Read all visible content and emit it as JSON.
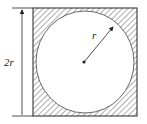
{
  "diagram": {
    "labels": {
      "radius": "r",
      "side": "2r"
    },
    "colors": {
      "stroke": "#222222",
      "background": "#ffffff"
    },
    "elements": [
      {
        "type": "square",
        "side_label": "2r",
        "fill": "hatched"
      },
      {
        "type": "circle",
        "inscribed": true,
        "fill": "white"
      },
      {
        "type": "radius-arrow",
        "label": "r"
      },
      {
        "type": "center-point"
      },
      {
        "type": "dimension-arrow",
        "label": "2r",
        "orientation": "vertical"
      }
    ]
  }
}
